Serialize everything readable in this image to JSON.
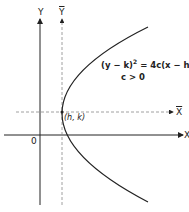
{
  "diagram": {
    "axes": {
      "x_label": "X",
      "y_label": "Y",
      "x_bar_label": "X",
      "y_bar_label": "Y",
      "origin_label": "0"
    },
    "vertex_label": "(h, k)",
    "equation": {
      "lhs": "(y − k)",
      "exp": "2",
      "rhs": " = 4c(x − h)",
      "condition": "c > 0"
    },
    "colors": {
      "line": "#222222",
      "dashed": "#888888"
    }
  }
}
